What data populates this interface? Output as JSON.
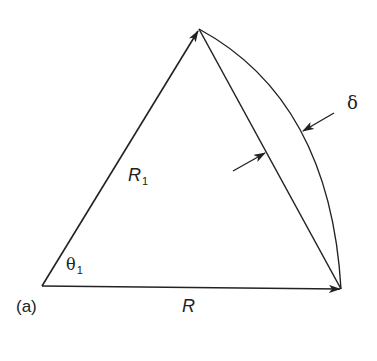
{
  "figure": {
    "panel_label": "(a)",
    "vectors": [
      {
        "name": "R1",
        "label": "R",
        "subscript": "1",
        "from": [
          42,
          286
        ],
        "to": [
          199,
          29
        ]
      },
      {
        "name": "R",
        "label": "R",
        "subscript": "",
        "from": [
          42,
          286
        ],
        "to": [
          341,
          289
        ]
      }
    ],
    "chord": {
      "from": [
        199,
        29
      ],
      "to": [
        341,
        289
      ]
    },
    "arc": {
      "from": [
        199,
        29
      ],
      "to": [
        341,
        289
      ]
    },
    "angle": {
      "symbol": "θ",
      "subscript": "1"
    },
    "deviation": {
      "symbol": "δ"
    },
    "colors": {
      "stroke": "#222222",
      "background": "#ffffff"
    }
  }
}
